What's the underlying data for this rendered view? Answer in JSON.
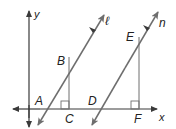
{
  "diagram": {
    "type": "coordinate geometry figure",
    "colors": {
      "lines": "#6e6e6e",
      "axes": "#3a3a3a",
      "text": "#222222",
      "background": "#ffffff"
    },
    "axes": {
      "x_label": "x",
      "y_label": "y"
    },
    "lines": [
      {
        "name": "line-l",
        "label": "ℓ"
      },
      {
        "name": "line-n",
        "label": "n"
      }
    ],
    "points": {
      "A": "A",
      "B": "B",
      "C": "C",
      "D": "D",
      "E": "E",
      "F": "F"
    },
    "segments": [
      "BC (vertical, ⊥ x-axis at C)",
      "EF (vertical, ⊥ x-axis at F)"
    ],
    "right_angle_marks": [
      "C",
      "F"
    ]
  }
}
